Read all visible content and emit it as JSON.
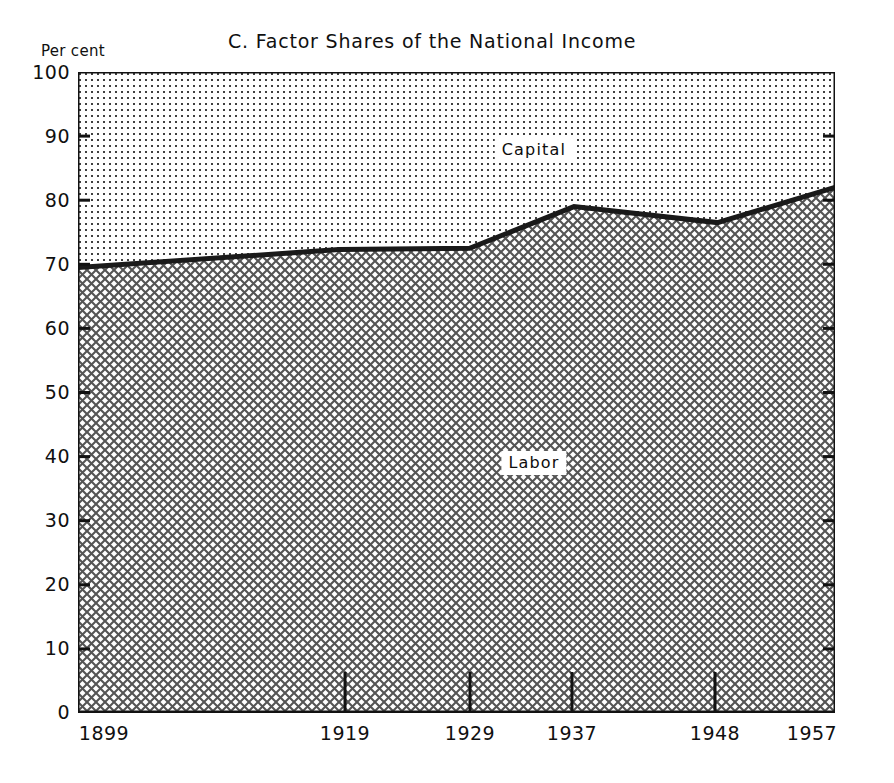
{
  "chart_data": {
    "type": "area",
    "title": "C.  Factor Shares of the National Income",
    "xlabel": "",
    "ylabel": "Per cent",
    "ylim": [
      0,
      100
    ],
    "grid": false,
    "legend_position": "inside-bands",
    "x_tick_labels": [
      "1899",
      "1919",
      "1929",
      "1937",
      "1948",
      "1957"
    ],
    "x_tick_values": [
      1899,
      1919,
      1929,
      1937,
      1948,
      1957
    ],
    "y_tick_labels": [
      "0",
      "10",
      "20",
      "30",
      "40",
      "50",
      "60",
      "70",
      "80",
      "90",
      "100"
    ],
    "y_tick_values": [
      0,
      10,
      20,
      30,
      40,
      50,
      60,
      70,
      80,
      90,
      100
    ],
    "categories": [
      1899,
      1919,
      1929,
      1937,
      1948,
      1957
    ],
    "series": [
      {
        "name": "Labor",
        "label": "Labor",
        "fill": "cross-hatch",
        "values": [
          69.5,
          72.3,
          72.5,
          79.0,
          76.5,
          82.0
        ]
      },
      {
        "name": "Capital",
        "label": "Capital",
        "fill": "fine-dots",
        "values": [
          30.5,
          27.7,
          27.5,
          21.0,
          23.5,
          18.0
        ]
      }
    ],
    "annotations": [
      {
        "text": "Capital",
        "x": 1923,
        "y": 89
      },
      {
        "text": "Labor",
        "x": 1923,
        "y": 41
      }
    ],
    "colors": {
      "boundary_line": "#1a1a1a",
      "axis": "#121212",
      "pattern_ink": "#4a4a4a",
      "background": "#ffffff"
    }
  },
  "labels": {
    "title": "C.  Factor Shares of the National Income",
    "y_unit": "Per cent",
    "capital": "Capital",
    "labor": "Labor",
    "y_ticks": [
      "100",
      "90",
      "80",
      "70",
      "60",
      "50",
      "40",
      "30",
      "20",
      "10",
      "0"
    ],
    "x_ticks": [
      "1899",
      "1919",
      "1929",
      "1937",
      "1948",
      "1957"
    ]
  }
}
